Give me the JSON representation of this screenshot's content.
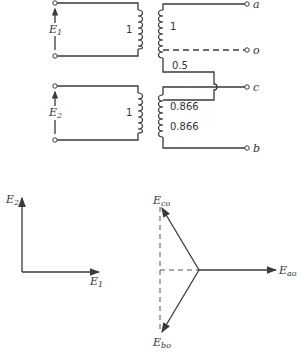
{
  "circuit": {
    "primary_top": {
      "voltage_label": "E",
      "voltage_sub": "1",
      "turns_ratio": "1"
    },
    "primary_bottom": {
      "voltage_label": "E",
      "voltage_sub": "2",
      "turns_ratio": "1"
    },
    "secondary_top": {
      "upper_turns": "1",
      "lower_turns": "0.5"
    },
    "secondary_bottom": {
      "upper_turns": "0.866",
      "lower_turns": "0.866"
    },
    "terminals": [
      "a",
      "o",
      "c",
      "b"
    ]
  },
  "phasor_input": {
    "x_label": "E",
    "x_sub": "1",
    "y_label": "E",
    "y_sub": "2"
  },
  "phasor_output": {
    "ao_label": "E",
    "ao_sub": "ao",
    "co_label": "E",
    "co_sub": "co",
    "bo_label": "E",
    "bo_sub": "bo"
  }
}
